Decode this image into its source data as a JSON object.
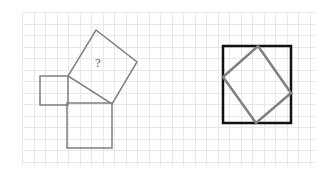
{
  "canvas": {
    "width": 327,
    "height": 175,
    "background_color": "#ffffff"
  },
  "grid": {
    "visible": true,
    "color": "#e9e7ea",
    "cell_size": 11.5,
    "x_start": 22,
    "x_end": 315,
    "y_start": 12,
    "y_end": 166,
    "line_width": 1
  },
  "colors": {
    "thin_gray_stroke": "#7f7f7f",
    "thick_black_stroke": "#111111",
    "label_text": "#5a5a5a",
    "grid_line": "#e9e7ea",
    "background": "#ffffff"
  },
  "figures": [
    {
      "id": "left-figure",
      "name": "pythagorean-squares-figure",
      "description": "Three squares arranged around a right triangle; the largest square is rotated and labeled with a question mark.",
      "stroke_color": "#7f7f7f",
      "stroke_width": 1.5,
      "fill": "none",
      "shapes": [
        {
          "id": "small-square-left",
          "name": "small-square-left",
          "type": "square",
          "points": "40,76 68,76 68,105 40,105",
          "side_length_px": 28.5
        },
        {
          "id": "medium-square-bottom",
          "name": "medium-square-bottom",
          "type": "square",
          "points": "67,103 112,103 112,148 67,148",
          "side_length_px": 45
        },
        {
          "id": "rotated-square-unknown",
          "name": "rotated-square-unknown",
          "type": "square",
          "points": "96,30 137,62 112,104 68,76",
          "side_length_px": 52,
          "rotation_deg": 38,
          "label": "?"
        }
      ],
      "label": {
        "text": "?",
        "x": 98,
        "y": 67,
        "font_size": 13,
        "color": "#5a5a5a"
      }
    },
    {
      "id": "right-figure",
      "name": "inscribed-square-figure",
      "description": "A thick black outer square with a thin gray square inscribed at a tilt, its four vertices touching the outer square's sides.",
      "shapes": [
        {
          "id": "outer-square",
          "name": "outer-square",
          "type": "square",
          "points": "223,46 291,46 291,123 223,123",
          "stroke_color": "#111111",
          "stroke_width": 2.5,
          "fill": "none"
        },
        {
          "id": "inner-tilted-square",
          "name": "inner-tilted-square",
          "type": "square",
          "points": "258,46 291,93 256,123 223,77",
          "stroke_color": "#7f7f7f",
          "stroke_width": 2.5,
          "fill": "none",
          "rotation_deg": 35
        }
      ]
    }
  ]
}
